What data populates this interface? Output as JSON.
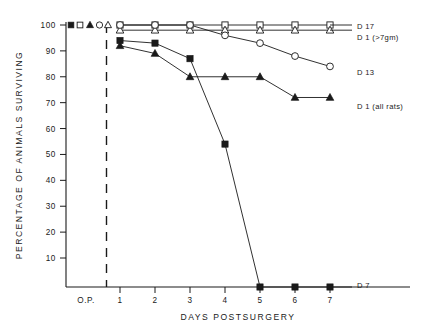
{
  "chart_data": {
    "type": "line",
    "title": "",
    "xlabel": "DAYS  POSTSURGERY",
    "ylabel": "PERCENTAGE  OF  ANIMALS  SURVIVING",
    "x": [
      0,
      1,
      2,
      3,
      4,
      5,
      6,
      7
    ],
    "xtick_labels": [
      "O.P.",
      "1",
      "2",
      "3",
      "4",
      "5",
      "6",
      "7"
    ],
    "ytick_labels": [
      "10",
      "20",
      "30",
      "40",
      "50",
      "60",
      "70",
      "80",
      "90",
      "100"
    ],
    "ytick_values": [
      10,
      20,
      30,
      40,
      50,
      60,
      70,
      80,
      90,
      100
    ],
    "ylim": [
      0,
      104
    ],
    "grid": false,
    "legend_position": "right",
    "preop_divider": true,
    "series": [
      {
        "name": "D 17",
        "label": "D 17",
        "marker": "open-square",
        "values": [
          100,
          100,
          100,
          100,
          100,
          100,
          100,
          100
        ]
      },
      {
        "name": "D 1 (>7gm)",
        "label": "D 1 (>7gm)",
        "marker": "open-triangle",
        "values": [
          100,
          98,
          98,
          98,
          98,
          98,
          98,
          98
        ]
      },
      {
        "name": "D 13",
        "label": "D 13",
        "marker": "open-circle",
        "values": [
          100,
          100,
          100,
          100,
          96,
          93,
          88,
          84
        ]
      },
      {
        "name": "D 1 (all rats)",
        "label": "D 1 (all rats)",
        "marker": "filled-triangle",
        "values": [
          100,
          92,
          89,
          80,
          80,
          80,
          72,
          72
        ]
      },
      {
        "name": "D 7",
        "label": "D 7",
        "marker": "filled-square",
        "values": [
          100,
          94,
          93,
          87,
          54,
          1,
          1,
          1
        ]
      }
    ],
    "legend_entries": [
      {
        "label": "D 17",
        "marker": "open-square"
      },
      {
        "label": "D 1 (>7gm)",
        "marker": "open-triangle"
      },
      {
        "label": "D 13",
        "marker": "open-circle"
      },
      {
        "label": "D 1 (all rats)",
        "marker": "filled-triangle"
      },
      {
        "label": "D 7",
        "marker": "filled-square"
      }
    ],
    "preop_markers": [
      {
        "marker": "filled-square"
      },
      {
        "marker": "open-square"
      },
      {
        "marker": "filled-triangle"
      },
      {
        "marker": "open-circle"
      },
      {
        "marker": "open-triangle"
      }
    ]
  }
}
